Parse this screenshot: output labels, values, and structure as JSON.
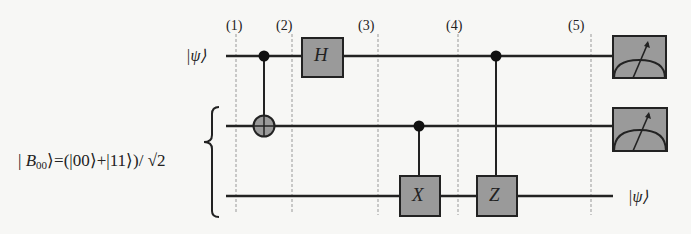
{
  "diagram": {
    "colors": {
      "background": "#f7f7f5",
      "wire": "#222222",
      "gate_fill": "#9a9a9a",
      "gate_stroke": "#222222",
      "dashed": "#999999"
    },
    "steps": [
      {
        "label": "(1)",
        "x": 236
      },
      {
        "label": "(2)",
        "x": 292
      },
      {
        "label": "(3)",
        "x": 378
      },
      {
        "label": "(4)",
        "x": 458
      },
      {
        "label": "(5)",
        "x": 591
      }
    ],
    "input_label": "|ψ⟩",
    "output_label": "|ψ⟩",
    "bell_state": {
      "prefix": "| ",
      "B": "B",
      "sub": "00",
      "rest": "⟩=(|00⟩+|11⟩)/ √2"
    },
    "wires": [
      {
        "name": "qubit-1",
        "y": 56
      },
      {
        "name": "qubit-2",
        "y": 126
      },
      {
        "name": "qubit-3",
        "y": 196
      }
    ],
    "gates": [
      {
        "type": "CNOT",
        "control_wire": 1,
        "target_wire": 2,
        "x": 264
      },
      {
        "type": "H",
        "label": "H",
        "wire": 1,
        "x": 322
      },
      {
        "type": "controlled-X",
        "label": "X",
        "control_wire": 2,
        "target_wire": 3,
        "x": 419
      },
      {
        "type": "controlled-Z",
        "label": "Z",
        "control_wire": 1,
        "target_wire": 3,
        "x": 496
      },
      {
        "type": "measurement",
        "wire": 1,
        "x": 639
      },
      {
        "type": "measurement",
        "wire": 2,
        "x": 639
      }
    ]
  }
}
